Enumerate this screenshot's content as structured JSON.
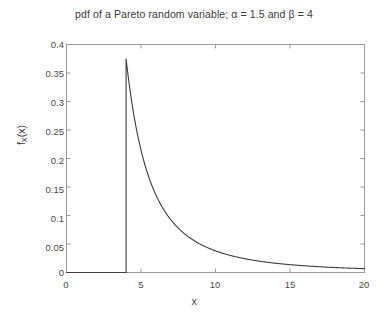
{
  "figure": {
    "background_color": "#ffffff",
    "axis_color": "#9a9a9a",
    "curve_color": "#3c3c3c",
    "text_color": "#3a3a3a"
  },
  "title": "pdf of a Pareto random variable; α = 1.5 and β = 4",
  "xlabel": "x",
  "ylabel_main": "f",
  "ylabel_sub": "X",
  "ylabel_tail": "(x)",
  "chart_data": {
    "type": "line",
    "title": "pdf of a Pareto random variable; α = 1.5 and β = 4",
    "xlabel": "x",
    "ylabel": "f_X(x)",
    "xlim": [
      0,
      20
    ],
    "ylim": [
      0,
      0.4
    ],
    "grid": false,
    "legend": null,
    "xticks": [
      0,
      5,
      10,
      15,
      20
    ],
    "xticklabels": [
      "0",
      "5",
      "10",
      "15",
      "20"
    ],
    "yticks": [
      0,
      0.05,
      0.1,
      0.15,
      0.2,
      0.25,
      0.3,
      0.35,
      0.4
    ],
    "yticklabels": [
      "0",
      "0.05",
      "0.1",
      "0.15",
      "0.2",
      "0.25",
      "0.3",
      "0.35",
      "0.4"
    ],
    "parameters": {
      "alpha": 1.5,
      "beta": 4
    },
    "peak": {
      "x": 4,
      "y": 0.375
    },
    "series": [
      {
        "name": "pdf",
        "x": [
          0,
          0.5,
          1,
          1.5,
          2,
          2.5,
          3,
          3.5,
          3.99,
          4,
          4.25,
          4.5,
          4.75,
          5,
          5.5,
          6,
          6.5,
          7,
          7.5,
          8,
          8.5,
          9,
          9.5,
          10,
          10.5,
          11,
          11.5,
          12,
          12.5,
          13,
          13.5,
          14,
          14.5,
          15,
          15.5,
          16,
          16.5,
          17,
          17.5,
          18,
          18.5,
          19,
          19.5,
          20
        ],
        "values": [
          0,
          0,
          0,
          0,
          0,
          0,
          0,
          0,
          0,
          0.375,
          0.3429,
          0.3146,
          0.2897,
          0.2683,
          0.2322,
          0.2041,
          0.1811,
          0.1621,
          0.1463,
          0.1326,
          0.1209,
          0.1111,
          0.1022,
          0.0949,
          0.0881,
          0.0823,
          0.077,
          0.0722,
          0.068,
          0.0641,
          0.0606,
          0.0573,
          0.0544,
          0.0517,
          0.0492,
          0.0469,
          0.0448,
          0.0428,
          0.041,
          0.0393,
          0.0377,
          0.0362,
          0.0349,
          0.0335
        ]
      }
    ]
  }
}
